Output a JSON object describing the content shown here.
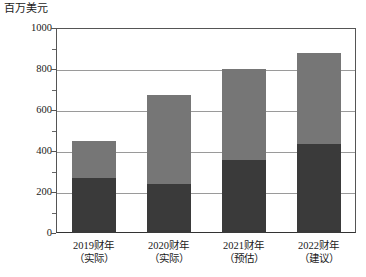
{
  "chart_data": {
    "type": "bar",
    "subtype": "stacked",
    "title": "百万美元",
    "xlabel": "",
    "ylabel": "百万美元",
    "ylim": [
      0,
      1000
    ],
    "ytick_step": 200,
    "yminor_step": 100,
    "grid": true,
    "legend": null,
    "categories": [
      "2019财年（实际）",
      "2020财年（实际）",
      "2021财年（预估）",
      "2022财年（建议）"
    ],
    "category_lines": [
      {
        "line1": "2019财年",
        "line2": "（实际）"
      },
      {
        "line1": "2020财年",
        "line2": "（实际）"
      },
      {
        "line1": "2021财年",
        "line2": "（预估）"
      },
      {
        "line1": "2022财年",
        "line2": "（建议）"
      }
    ],
    "ytick_labels": [
      "0",
      "200",
      "400",
      "600",
      "800",
      "1000"
    ],
    "ytick_values": [
      0,
      200,
      400,
      600,
      800,
      1000
    ],
    "yminor_values": [
      100,
      300,
      500,
      700,
      900
    ],
    "series": [
      {
        "name": "下段",
        "color": "#3a3a3a",
        "values": [
          270,
          240,
          355,
          435
        ]
      },
      {
        "name": "上段",
        "color": "#767676",
        "values": [
          180,
          435,
          445,
          445
        ]
      }
    ],
    "totals": [
      450,
      675,
      800,
      880
    ]
  },
  "colors": {
    "segment_bottom": "#3a3a3a",
    "segment_top": "#767676",
    "gridline": "#9a9a9a",
    "axis": "#555555",
    "background": "#ffffff",
    "text": "#1a1a1a"
  }
}
